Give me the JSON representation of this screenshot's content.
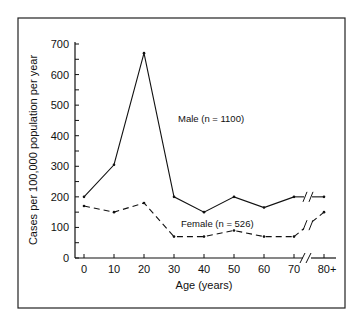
{
  "chart_data": {
    "type": "line",
    "title": "",
    "xlabel": "Age (years)",
    "ylabel": "Cases per 100,000 population per year",
    "categories": [
      "0",
      "10",
      "20",
      "30",
      "40",
      "50",
      "60",
      "70",
      "80+"
    ],
    "x": [
      0,
      10,
      20,
      30,
      40,
      50,
      60,
      70,
      80
    ],
    "series": [
      {
        "name": "Male (n = 1100)",
        "style": "solid",
        "values": [
          200,
          305,
          670,
          200,
          150,
          200,
          165,
          200,
          200
        ]
      },
      {
        "name": "Female (n = 526)",
        "style": "dashed",
        "values": [
          170,
          150,
          180,
          70,
          70,
          90,
          70,
          70,
          150
        ]
      }
    ],
    "yticks": [
      0,
      100,
      200,
      300,
      400,
      500,
      600,
      700
    ],
    "ylim": [
      0,
      700
    ],
    "xlim": [
      0,
      80
    ],
    "grid": false,
    "legend": "inline labels near lines",
    "annotations": [
      "axis break between 70 and 80+"
    ]
  },
  "labels": {
    "male": "Male (n = 1100)",
    "female": "Female (n = 526)",
    "xlabel": "Age (years)",
    "ylabel": "Cases per 100,000 population per year"
  }
}
